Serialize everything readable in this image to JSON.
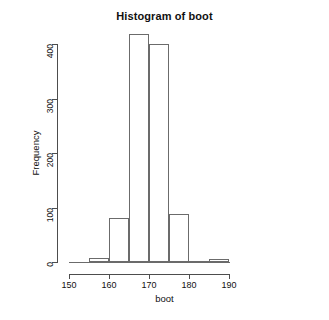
{
  "chart_data": {
    "type": "bar",
    "title": "Histogram of boot",
    "xlabel": "boot",
    "ylabel": "Frequency",
    "xlim": [
      148,
      192
    ],
    "ylim": [
      0,
      430
    ],
    "grid": false,
    "legend": "none",
    "bin_width": 5,
    "bin_edges": [
      150,
      155,
      160,
      165,
      170,
      175,
      180,
      185,
      190
    ],
    "categories": [
      "150-155",
      "155-160",
      "160-165",
      "165-170",
      "170-175",
      "175-180",
      "180-185",
      "185-190"
    ],
    "values": [
      0,
      7,
      80,
      418,
      400,
      88,
      2,
      5
    ],
    "x_ticks": [
      150,
      160,
      170,
      180,
      190
    ],
    "x_tick_labels": [
      "150",
      "160",
      "170",
      "180",
      "190"
    ],
    "y_ticks": [
      0,
      100,
      200,
      300,
      400
    ],
    "y_tick_labels": [
      "0",
      "100",
      "200",
      "300",
      "400"
    ]
  },
  "plot": {
    "title": "Histogram of boot",
    "x_axis_title": "boot",
    "y_axis_title": "Frequency"
  }
}
